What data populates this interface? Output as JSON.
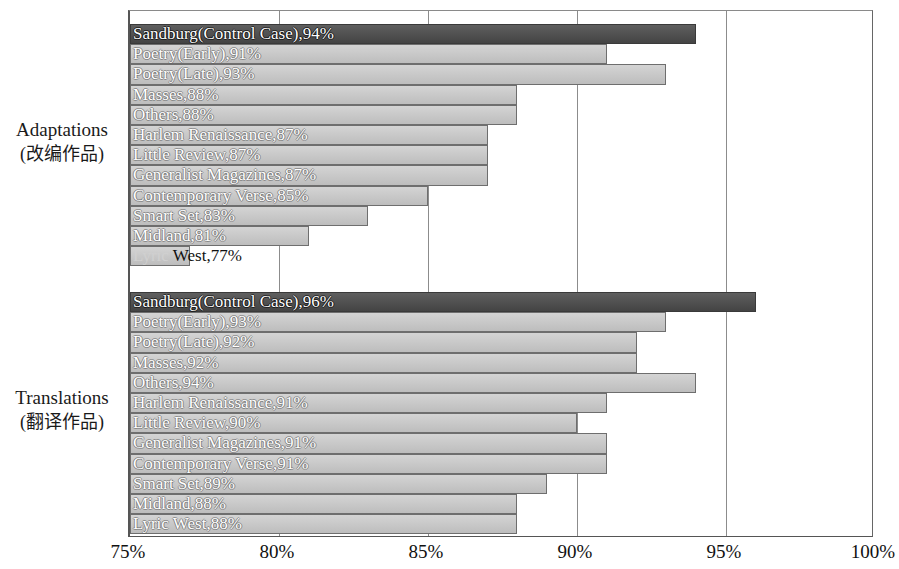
{
  "chart": {
    "type": "bar",
    "orientation": "horizontal",
    "xlabel": "",
    "ylabel": "",
    "xlim": [
      75,
      100
    ],
    "xticks": [
      "75%",
      "80%",
      "85%",
      "90%",
      "95%",
      "100%"
    ],
    "xtick_values": [
      75,
      80,
      85,
      90,
      95,
      100
    ],
    "grid": true,
    "colors": {
      "bar": "#c9c9c9",
      "control_bar": "#4d4d4d",
      "bar_border": "#6e6e6e",
      "label_text": "#ffffff",
      "axis": "#555555",
      "background": "#ffffff"
    }
  },
  "groups": [
    {
      "label_en": "Adaptations",
      "label_cn": "(改编作品)",
      "bars": [
        {
          "name": "Sandburg(Control Case)",
          "value": 94,
          "label": "Sandburg(Control Case),94%",
          "control": true
        },
        {
          "name": "Poetry(Early)",
          "value": 91,
          "label": "Poetry(Early),91%",
          "control": false
        },
        {
          "name": "Poetry(Late)",
          "value": 93,
          "label": "Poetry(Late),93%",
          "control": false
        },
        {
          "name": "Masses",
          "value": 88,
          "label": "Masses,88%",
          "control": false
        },
        {
          "name": "Others",
          "value": 88,
          "label": "Others,88%",
          "control": false
        },
        {
          "name": "Harlem Renaissance",
          "value": 87,
          "label": "Harlem Renaissance,87%",
          "control": false
        },
        {
          "name": "Little Review",
          "value": 87,
          "label": "Little Review,87%",
          "control": false
        },
        {
          "name": "Generalist Magazines",
          "value": 87,
          "label": "Generalist Magazines,87%",
          "control": false
        },
        {
          "name": "Contemporary Verse",
          "value": 85,
          "label": "Contemporary Verse,85%",
          "control": false
        },
        {
          "name": "Smart Set",
          "value": 83,
          "label": "Smart Set,83%",
          "control": false
        },
        {
          "name": "Midland",
          "value": 81,
          "label": "Midland,81%",
          "control": false
        },
        {
          "name": "Lyric West",
          "value": 77,
          "label": "Lyric West,77%",
          "control": false
        }
      ]
    },
    {
      "label_en": "Translations",
      "label_cn": "(翻译作品)",
      "bars": [
        {
          "name": "Sandburg(Control Case)",
          "value": 96,
          "label": "Sandburg(Control Case),96%",
          "control": true
        },
        {
          "name": "Poetry(Early)",
          "value": 93,
          "label": "Poetry(Early),93%",
          "control": false
        },
        {
          "name": "Poetry(Late)",
          "value": 92,
          "label": "Poetry(Late),92%",
          "control": false
        },
        {
          "name": "Masses",
          "value": 92,
          "label": "Masses,92%",
          "control": false
        },
        {
          "name": "Others",
          "value": 94,
          "label": "Others,94%",
          "control": false
        },
        {
          "name": "Harlem Renaissance",
          "value": 91,
          "label": "Harlem Renaissance,91%",
          "control": false
        },
        {
          "name": "Little Review",
          "value": 90,
          "label": "Little Review,90%",
          "control": false
        },
        {
          "name": "Generalist Magazines",
          "value": 91,
          "label": "Generalist Magazines,91%",
          "control": false
        },
        {
          "name": "Contemporary Verse",
          "value": 91,
          "label": "Contemporary Verse,91%",
          "control": false
        },
        {
          "name": "Smart Set",
          "value": 89,
          "label": "Smart Set,89%",
          "control": false
        },
        {
          "name": "Midland",
          "value": 88,
          "label": "Midland,88%",
          "control": false
        },
        {
          "name": "Lyric West",
          "value": 88,
          "label": "Lyric West,88%",
          "control": false
        }
      ]
    }
  ],
  "chart_data": {
    "type": "bar",
    "title": "",
    "xlabel": "",
    "ylabel": "",
    "xlim": [
      75,
      100
    ],
    "grid": true,
    "legend": [],
    "categories": [
      "Sandburg(Control Case)",
      "Poetry(Early)",
      "Poetry(Late)",
      "Masses",
      "Others",
      "Harlem Renaissance",
      "Little Review",
      "Generalist Magazines",
      "Contemporary Verse",
      "Smart Set",
      "Midland",
      "Lyric West"
    ],
    "series": [
      {
        "name": "Adaptations (改编作品)",
        "values": [
          94,
          91,
          93,
          88,
          88,
          87,
          87,
          87,
          85,
          83,
          81,
          77
        ]
      },
      {
        "name": "Translations (翻译作品)",
        "values": [
          96,
          93,
          92,
          92,
          94,
          91,
          90,
          91,
          91,
          89,
          88,
          88
        ]
      }
    ],
    "xticks": [
      75,
      80,
      85,
      90,
      95,
      100
    ],
    "xticklabels": [
      "75%",
      "80%",
      "85%",
      "90%",
      "95%",
      "100%"
    ]
  }
}
